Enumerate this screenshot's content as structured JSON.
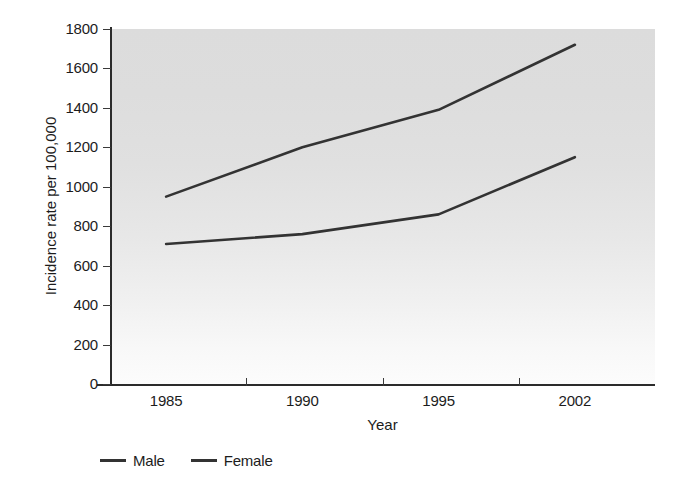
{
  "chart_data": {
    "type": "line",
    "title": "",
    "xlabel": "Year",
    "ylabel": "Incidence rate per 100,000",
    "categories": [
      "1985",
      "1990",
      "1995",
      "2002"
    ],
    "series": [
      {
        "name": "Male",
        "values": [
          950,
          1200,
          1390,
          1720
        ],
        "color": "#333333"
      },
      {
        "name": "Female",
        "values": [
          710,
          760,
          860,
          1150
        ],
        "color": "#333333"
      }
    ],
    "ylim": [
      0,
      1800
    ],
    "ytick_values": [
      0,
      200,
      400,
      600,
      800,
      1000,
      1200,
      1400,
      1600,
      1800
    ],
    "ytick_labels": [
      "0",
      "200",
      "400",
      "600",
      "800",
      "1000",
      "1200",
      "1400",
      "1600",
      "1800"
    ],
    "grid": false,
    "legend_position": "bottom-left",
    "plot_background": "#e0e0e0",
    "axis_color": "#2b2b2b"
  },
  "legend": {
    "items": [
      {
        "label": "Male"
      },
      {
        "label": "Female"
      }
    ]
  },
  "axes": {
    "x_title": "Year",
    "y_title": "Incidence rate per 100,000"
  }
}
